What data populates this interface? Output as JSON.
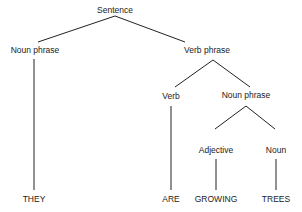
{
  "diagram": {
    "type": "parse-tree",
    "nodes": {
      "root": "Sentence",
      "np_left": "Noun phrase",
      "vp": "Verb phrase",
      "verb": "Verb",
      "np_right": "Noun phrase",
      "adjective": "Adjective",
      "noun": "Noun"
    },
    "leaves": {
      "they": "THEY",
      "are": "ARE",
      "growing": "GROWING",
      "trees": "TREES"
    },
    "edges": [
      [
        "Sentence",
        "Noun phrase"
      ],
      [
        "Sentence",
        "Verb phrase"
      ],
      [
        "Noun phrase",
        "THEY"
      ],
      [
        "Verb phrase",
        "Verb"
      ],
      [
        "Verb phrase",
        "Noun phrase"
      ],
      [
        "Verb",
        "ARE"
      ],
      [
        "Noun phrase",
        "Adjective"
      ],
      [
        "Noun phrase",
        "Noun"
      ],
      [
        "Adjective",
        "GROWING"
      ],
      [
        "Noun",
        "TREES"
      ]
    ]
  }
}
